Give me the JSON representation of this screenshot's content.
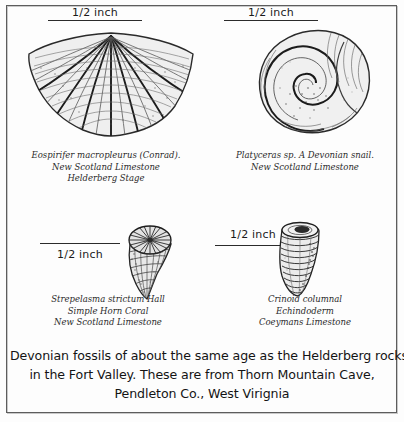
{
  "plate": {
    "title": "Devonian fossils plate",
    "background_color": "#fdfdfd",
    "border_color": "#5d5d5d",
    "ink_color": "#2b2b2b"
  },
  "specimens": [
    {
      "id": "brachiopod",
      "common_name": "brachiopod-shell",
      "scale": {
        "label": "1/2 inch",
        "rule_position": "below"
      },
      "caption": [
        "Eospirifer macropleurus (Conrad).",
        "New Scotland Limestone",
        "Helderberg Stage"
      ]
    },
    {
      "id": "snail",
      "common_name": "gastropod-snail-shell",
      "scale": {
        "label": "1/2 inch",
        "rule_position": "below"
      },
      "caption": [
        "Platyceras sp. A Devonian snail.",
        "New Scotland Limestone"
      ]
    },
    {
      "id": "horn-coral",
      "common_name": "simple-horn-coral",
      "scale": {
        "label": "1/2 inch",
        "rule_position": "above"
      },
      "caption": [
        "Strepelasma strictum Hall",
        "Simple Horn Coral",
        "New Scotland Limestone"
      ]
    },
    {
      "id": "crinoid",
      "common_name": "crinoid-columnal",
      "scale": {
        "label": "1/2 inch",
        "rule_position": "below"
      },
      "caption": [
        "Crinoid columnal",
        "Echindoderm",
        "Coeymans Limestone"
      ]
    }
  ],
  "bottom_caption": {
    "lines": [
      "Devonian fossils of about the same age as the Helderberg rocks",
      "in the Fort Valley.  These are from Thorn Mountain Cave,",
      "Pendleton Co., West Virignia"
    ]
  }
}
